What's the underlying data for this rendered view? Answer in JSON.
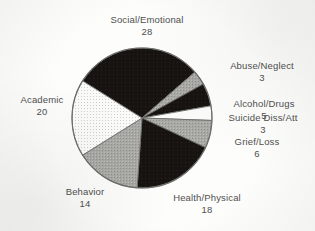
{
  "chart_data": {
    "type": "pie",
    "title": "",
    "total": 94,
    "categories": [
      "Social/Emotional",
      "Abuse/Neglect",
      "Alcohol/Drugs",
      "Suicide Diss/Att",
      "Grief/Loss",
      "Health/Physical",
      "Behavior",
      "Academic"
    ],
    "values": [
      28,
      3,
      5,
      3,
      6,
      18,
      14,
      20
    ],
    "slices": [
      {
        "label": "Social/Emotional",
        "value": 28,
        "fill": "black",
        "start_deg": -58,
        "end_deg": 49
      },
      {
        "label": "Abuse/Neglect",
        "value": 3,
        "fill": "gray",
        "start_deg": 49,
        "end_deg": 61
      },
      {
        "label": "Alcohol/Drugs",
        "value": 5,
        "fill": "black",
        "start_deg": 61,
        "end_deg": 80
      },
      {
        "label": "Suicide Diss/Att",
        "value": 3,
        "fill": "white",
        "start_deg": 80,
        "end_deg": 92
      },
      {
        "label": "Grief/Loss",
        "value": 6,
        "fill": "gray",
        "start_deg": 92,
        "end_deg": 115
      },
      {
        "label": "Health/Physical",
        "value": 18,
        "fill": "black",
        "start_deg": 115,
        "end_deg": 184
      },
      {
        "label": "Behavior",
        "value": 14,
        "fill": "gray",
        "start_deg": 184,
        "end_deg": 238
      },
      {
        "label": "Academic",
        "value": 20,
        "fill": "dotted",
        "start_deg": 238,
        "end_deg": 302
      }
    ],
    "legend": "none",
    "grid": false
  },
  "labels": {
    "social_emotional": {
      "name": "Social/Emotional",
      "value": "28"
    },
    "abuse_neglect": {
      "name": "Abuse/Neglect",
      "value": "3"
    },
    "alcohol_drugs": {
      "name": "Alcohol/Drugs",
      "value": "5"
    },
    "suicide": {
      "name": "Suicide Diss/Att",
      "value": "3"
    },
    "grief_loss": {
      "name": "Grief/Loss",
      "value": "6"
    },
    "health_physical": {
      "name": "Health/Physical",
      "value": "18"
    },
    "behavior": {
      "name": "Behavior",
      "value": "14"
    },
    "academic": {
      "name": "Academic",
      "value": "20"
    }
  },
  "colors": {
    "black": "#171310",
    "gray": "#a3a3a0",
    "white": "#fbfbf9",
    "dotted": "#f4f4f1",
    "outline": "#6d6d6a",
    "text": "#4f4f4f",
    "page": "#fdfdfb"
  }
}
